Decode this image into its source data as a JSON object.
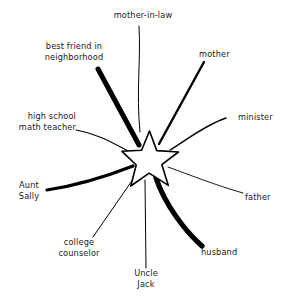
{
  "diagram": {
    "type": "social-atom-star",
    "title": "",
    "center_node": {
      "name": "star-center",
      "shape": "five-pointed-star",
      "label": "",
      "stroke_color": "#000000",
      "fill_color": "#ffffff"
    },
    "line_color": "#000000",
    "background_color": "#ffffff",
    "text_color": "#1a1a1a",
    "connections": [
      {
        "id": "mother-in-law",
        "label_lines": [
          "mother-in-law"
        ],
        "label_text": "mother-in-law",
        "thickness": 1,
        "thickness_label": "thin",
        "direction": "top",
        "closeness": "distant"
      },
      {
        "id": "best-friend-in-neighborhood",
        "label_lines": [
          "best friend in",
          "neighborhood"
        ],
        "label_text": "best friend in neighborhood",
        "thickness": 5,
        "thickness_label": "very-thick",
        "direction": "upper-left",
        "closeness": "very-close"
      },
      {
        "id": "mother",
        "label_lines": [
          "mother"
        ],
        "label_text": "mother",
        "thickness": 2.4,
        "thickness_label": "medium",
        "direction": "upper-right",
        "closeness": "moderate"
      },
      {
        "id": "high-school-math-teacher",
        "label_lines": [
          "high school",
          "math teacher"
        ],
        "label_text": "high school math teacher",
        "thickness": 1,
        "thickness_label": "thin",
        "direction": "left",
        "closeness": "distant"
      },
      {
        "id": "minister",
        "label_lines": [
          "minister"
        ],
        "label_text": "minister",
        "thickness": 1.3,
        "thickness_label": "thin",
        "direction": "right",
        "closeness": "distant"
      },
      {
        "id": "aunt-sally",
        "label_lines": [
          "Aunt",
          "Sally"
        ],
        "label_text": "Aunt Sally",
        "thickness": 3.2,
        "thickness_label": "thick",
        "direction": "lower-left",
        "closeness": "close"
      },
      {
        "id": "father",
        "label_lines": [
          "father"
        ],
        "label_text": "father",
        "thickness": 0.9,
        "thickness_label": "very-thin",
        "direction": "lower-right",
        "closeness": "very-distant"
      },
      {
        "id": "college-counselor",
        "label_lines": [
          "college",
          "counselor"
        ],
        "label_text": "college counselor",
        "thickness": 1,
        "thickness_label": "thin",
        "direction": "bottom-left",
        "closeness": "distant"
      },
      {
        "id": "husband",
        "label_lines": [
          "husband"
        ],
        "label_text": "husband",
        "thickness": 5.2,
        "thickness_label": "very-thick",
        "direction": "bottom-right",
        "closeness": "very-close"
      },
      {
        "id": "uncle-jack",
        "label_lines": [
          "Uncle",
          "Jack"
        ],
        "label_text": "Uncle Jack",
        "thickness": 1,
        "thickness_label": "thin",
        "direction": "bottom",
        "closeness": "distant"
      }
    ]
  },
  "labels": {
    "mother_in_law": "mother-in-law",
    "best_friend_l1": "best friend in",
    "best_friend_l2": "neighborhood",
    "mother": "mother",
    "teacher_l1": "high school",
    "teacher_l2": "math teacher",
    "minister": "minister",
    "aunt_l1": "Aunt",
    "aunt_l2": "Sally",
    "father": "father",
    "counselor_l1": "college",
    "counselor_l2": "counselor",
    "husband": "husband",
    "uncle_l1": "Uncle",
    "uncle_l2": "Jack"
  }
}
